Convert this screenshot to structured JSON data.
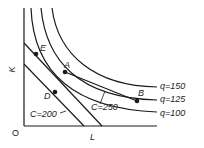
{
  "figure": {
    "axis_labels": {
      "y": "K",
      "x": "L",
      "origin": "O"
    },
    "isoquants": [
      {
        "label": "q=150",
        "value": 150
      },
      {
        "label": "q=125",
        "value": 125
      },
      {
        "label": "q=100",
        "value": 100
      }
    ],
    "isocosts": [
      {
        "label": "C=200",
        "value": 200
      },
      {
        "label": "C=250",
        "value": 250
      }
    ],
    "points": [
      {
        "label": "E"
      },
      {
        "label": "A"
      },
      {
        "label": "D"
      },
      {
        "label": "B"
      }
    ],
    "colors": {
      "ink": "#1a1a1a",
      "background": "#ffffff"
    }
  }
}
